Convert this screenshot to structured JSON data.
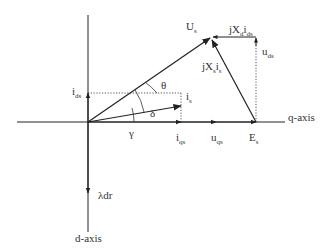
{
  "diagram": {
    "type": "phasor diagram",
    "axes": {
      "q_axis_label": "q-axis",
      "d_axis_label": "d-axis"
    },
    "vectors": {
      "Us": {
        "label": "U",
        "sub": "s"
      },
      "is": {
        "label": "i",
        "sub": "s"
      },
      "Es": {
        "label": "E",
        "sub": "s"
      },
      "ids": {
        "label": "i",
        "sub": "ds"
      },
      "iqs": {
        "label": "i",
        "sub": "qs"
      },
      "uqs": {
        "label": "u",
        "sub": "qs"
      },
      "uds": {
        "label": "u",
        "sub": "ds"
      },
      "lambda_dr": {
        "label": "λdr"
      },
      "jXs_is": {
        "p1": "jX",
        "s1": "s",
        "p2": "i",
        "s2": "s"
      },
      "jXd_ids": {
        "p1": "jX",
        "s1": "d",
        "p2": "i",
        "s2": "ds"
      }
    },
    "angles": {
      "theta": "θ",
      "delta": "δ",
      "gamma": "γ"
    },
    "colors": {
      "line": "#222222",
      "text": "#333333",
      "background": "#ffffff"
    }
  }
}
